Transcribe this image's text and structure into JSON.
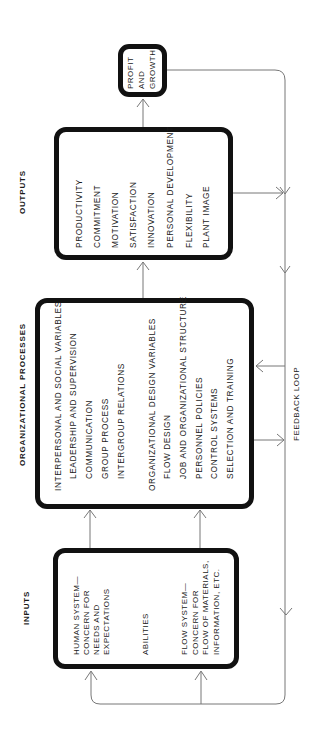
{
  "diagram": {
    "orientation": "rotated -90deg (reads bottom-to-top)",
    "sections": {
      "inputs": {
        "label": "INPUTS",
        "items": [
          "HUMAN SYSTEM—",
          "CONCERN FOR",
          "NEEDS AND",
          "EXPECTATIONS",
          "ABILITIES",
          "FLOW SYSTEM—",
          "CONCERN FOR",
          "FLOW OF MATERIALS,",
          "INFORMATION, ETC."
        ]
      },
      "processes": {
        "label": "ORGANIZATIONAL PROCESSES",
        "groups": [
          {
            "header": "INTERPERSONAL AND SOCIAL VARIABLES",
            "items": [
              "LEADERSHIP AND SUPERVISION",
              "COMMUNICATION",
              "GROUP PROCESS",
              "INTERGROUP RELATIONS"
            ]
          },
          {
            "header": "ORGANIZATIONAL DESIGN VARIABLES",
            "items": [
              "FLOW DESIGN",
              "JOB AND ORGANIZATIONAL STRUCTURE",
              "PERSONNEL POLICIES",
              "CONTROL SYSTEMS",
              "SELECTION AND TRAINING"
            ]
          }
        ]
      },
      "outputs": {
        "label": "OUTPUTS",
        "items": [
          "PRODUCTIVITY",
          "COMMITMENT",
          "MOTIVATION",
          "SATISFACTION",
          "INNOVATION",
          "PERSONAL DEVELOPMENT",
          "FLEXIBILITY",
          "PLANT IMAGE"
        ]
      },
      "result": {
        "lines": [
          "PROFIT",
          "AND",
          "GROWTH"
        ]
      }
    },
    "feedback": {
      "label": "FEEDBACK LOOP"
    },
    "colors": {
      "box_border": "#111111",
      "connector": "#777777",
      "text": "#1a1a1a",
      "background": "#ffffff"
    }
  }
}
